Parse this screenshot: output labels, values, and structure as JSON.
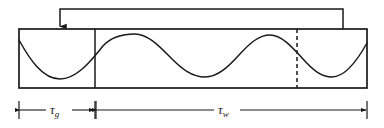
{
  "figure": {
    "type": "timing-diagram",
    "background_color": "#ffffff",
    "line_color": "#1a1a1a"
  },
  "box": {
    "name": "waveform-frame",
    "x": 19,
    "y": 29,
    "width": 348,
    "height": 59,
    "stroke_width": 1.6
  },
  "dividers": [
    {
      "name": "gap-divider",
      "x": 95,
      "style": "solid"
    },
    {
      "name": "window-end-divider",
      "x": 297,
      "style": "dashed",
      "dash": "4 3"
    }
  ],
  "waveform": {
    "name": "sine-wave",
    "kind": "sinusoid",
    "amplitude_px": 21,
    "period_px": 135,
    "phase_deg": 90,
    "baseline_y": 58,
    "x_start": 19,
    "x_end": 367,
    "extrema": [
      {
        "type": "trough",
        "x": 60
      },
      {
        "type": "peak",
        "x": 135
      },
      {
        "type": "trough",
        "x": 205
      },
      {
        "type": "peak",
        "x": 270
      },
      {
        "type": "trough",
        "x": 332
      }
    ]
  },
  "feedback_arrow": {
    "name": "feedback-loop-arrow",
    "from_x": 343,
    "top_y": 9,
    "to_x": 60,
    "to_y": 29,
    "direction": "right-to-left, arrowhead pointing down into frame"
  },
  "dimensions": [
    {
      "id": "tau-g",
      "name": "gap-duration",
      "symbol": "τ",
      "subscript": "g",
      "label": "τg",
      "from_x": 19,
      "to_x": 95,
      "y": 110,
      "arrows": "both",
      "ticks": [
        19,
        95
      ]
    },
    {
      "id": "tau-w",
      "name": "window-duration",
      "symbol": "τ",
      "subscript": "w",
      "label": "τw",
      "from_x": 95,
      "to_x": 367,
      "y": 110,
      "arrows": "both",
      "ticks": [
        95,
        367
      ]
    }
  ]
}
